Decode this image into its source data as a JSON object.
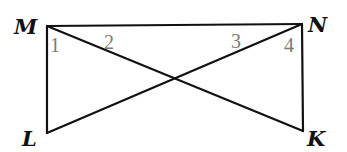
{
  "diagram": {
    "type": "geometry",
    "colors": {
      "line": "#111111",
      "vertex_label": "#111111",
      "angle_label": "#7a7a7a",
      "background": "#ffffff"
    },
    "vertices": [
      {
        "name": "M",
        "x": 47,
        "y": 26,
        "label_x": 14,
        "label_y": 34
      },
      {
        "name": "N",
        "x": 302,
        "y": 24,
        "label_x": 308,
        "label_y": 32
      },
      {
        "name": "L",
        "x": 47,
        "y": 133,
        "label_x": 22,
        "label_y": 146
      },
      {
        "name": "K",
        "x": 303,
        "y": 131,
        "label_x": 307,
        "label_y": 146
      }
    ],
    "segments": [
      [
        "M",
        "N"
      ],
      [
        "M",
        "L"
      ],
      [
        "N",
        "K"
      ],
      [
        "M",
        "K"
      ],
      [
        "N",
        "L"
      ]
    ],
    "angles": [
      {
        "label": "1",
        "x": 50,
        "y": 52
      },
      {
        "label": "2",
        "x": 104,
        "y": 49
      },
      {
        "label": "3",
        "x": 231,
        "y": 48
      },
      {
        "label": "4",
        "x": 284,
        "y": 52
      }
    ]
  }
}
